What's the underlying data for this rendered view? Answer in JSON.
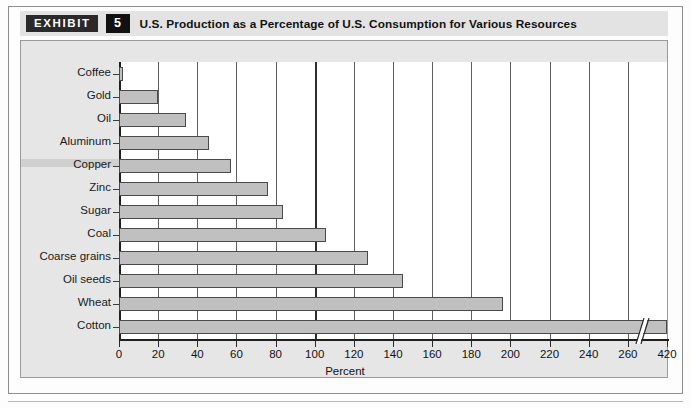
{
  "header": {
    "exhibit_tag": "EXHIBIT",
    "exhibit_number": "5",
    "title": "U.S. Production as a Percentage of U.S. Consumption for Various Resources"
  },
  "colors": {
    "bar_fill": "#c0c0c0",
    "bar_border": "#4a4a4a",
    "panel_background": "#e6e6e6",
    "plot_background": "#ffffff",
    "gridline": "#5e5e5e",
    "tag_background": "#2a2a2a"
  },
  "chart_data": {
    "type": "bar",
    "orientation": "horizontal",
    "title": "U.S. Production as a Percentage of U.S. Consumption for Various Resources",
    "xlabel": "Percent",
    "ylabel": "",
    "categories": [
      "Coffee",
      "Gold",
      "Oil",
      "Aluminum",
      "Copper",
      "Zinc",
      "Sugar",
      "Coal",
      "Coarse grains",
      "Oil seeds",
      "Wheat",
      "Cotton"
    ],
    "values": [
      2,
      20,
      34,
      46,
      57,
      76,
      84,
      106,
      127,
      145,
      196,
      420
    ],
    "value_labels": [
      "2",
      "20",
      "34",
      "46",
      "57",
      "76",
      "84",
      "106",
      "127",
      "145",
      "196",
      "420"
    ],
    "xlim": [
      0,
      280
    ],
    "xticks": [
      0,
      20,
      40,
      60,
      80,
      100,
      120,
      140,
      160,
      180,
      200,
      220,
      240,
      260,
      420
    ],
    "xtick_labels": [
      "0",
      "20",
      "40",
      "60",
      "80",
      "100",
      "120",
      "140",
      "160",
      "180",
      "200",
      "220",
      "240",
      "260",
      "420"
    ],
    "axis_break": {
      "present": true,
      "between": [
        260,
        420
      ],
      "note": "axis compressed after 260"
    },
    "grid": true,
    "grid_axis": "x",
    "highlight_gridline": 100,
    "legend": null,
    "bar_truncated_category": "Cotton"
  }
}
